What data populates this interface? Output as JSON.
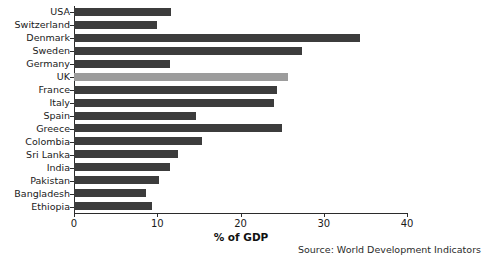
{
  "chart_data": {
    "type": "bar",
    "orientation": "horizontal",
    "title": "",
    "xlabel": "% of GDP",
    "ylabel": "",
    "xlim": [
      0,
      40
    ],
    "xticks": [
      0,
      10,
      20,
      30,
      40
    ],
    "grid": false,
    "legend": false,
    "categories": [
      "USA",
      "Switzerland",
      "Denmark",
      "Sweden",
      "Germany",
      "UK",
      "France",
      "Italy",
      "Spain",
      "Greece",
      "Colombia",
      "Sri Lanka",
      "India",
      "Pakistan",
      "Bangladesh",
      "Ethiopia"
    ],
    "values": [
      11.6,
      10.0,
      34.4,
      27.4,
      11.5,
      25.7,
      24.4,
      24.0,
      14.6,
      25.0,
      15.4,
      12.5,
      11.5,
      10.2,
      8.7,
      9.4
    ],
    "highlight_category": "UK",
    "colors": {
      "bar": "#3c3c3c",
      "bar_highlight": "#9c9c9c",
      "axis": "#2b2b2b",
      "text": "#1a1a1a",
      "background": "#ffffff"
    },
    "annotations": {
      "source": "Source: World Development Indicators"
    }
  }
}
